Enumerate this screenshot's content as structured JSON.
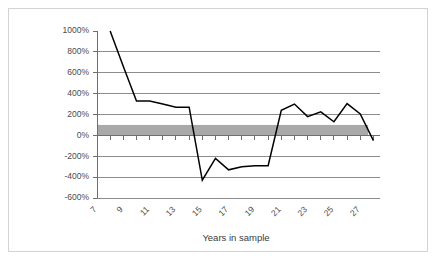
{
  "chart_data": {
    "type": "line",
    "title": "",
    "xlabel": "Years in sample",
    "ylabel": "",
    "xlim": [
      7,
      28.5
    ],
    "ylim": [
      -600,
      1000
    ],
    "grid": true,
    "legend": "none",
    "y_tick_labels": [
      "1000%",
      "800%",
      "600%",
      "400%",
      "200%",
      "0%",
      "-200%",
      "-400%",
      "-600%"
    ],
    "y_tick_values": [
      1000,
      800,
      600,
      400,
      200,
      0,
      -200,
      -400,
      -600
    ],
    "x_tick_labels": [
      "7",
      "9",
      "11",
      "13",
      "15",
      "17",
      "19",
      "21",
      "23",
      "25",
      "27"
    ],
    "x_tick_values": [
      7,
      9,
      11,
      13,
      15,
      17,
      19,
      21,
      23,
      25,
      27
    ],
    "x_minor_tick_interval": 1,
    "series": [
      {
        "name": "value",
        "color": "#000000",
        "x": [
          8,
          9,
          10,
          11,
          12,
          13,
          14,
          15,
          16,
          17,
          18,
          19,
          20,
          21,
          22,
          23,
          24,
          25,
          26,
          27,
          28
        ],
        "values": [
          1000,
          660,
          330,
          330,
          300,
          270,
          270,
          -430,
          -220,
          -330,
          -300,
          -290,
          -290,
          240,
          300,
          180,
          225,
          130,
          305,
          205,
          -50
        ]
      }
    ],
    "shaded_band": {
      "name": "reference-band",
      "color": "#a9a9a9",
      "y_min": 0,
      "y_max": 100,
      "x_start": 7,
      "x_end": 27.6
    },
    "annotations": []
  },
  "figure": {
    "background": "#ffffff",
    "border_color": "#d3d3d3",
    "gridline_color": "#8c8c8c",
    "axis_color": "#6e6e6e",
    "label_color": "#4a4a4a"
  }
}
